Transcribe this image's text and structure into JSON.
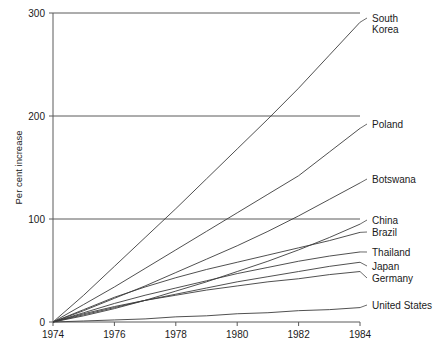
{
  "chart_data": {
    "type": "line",
    "title": "",
    "xlabel": "",
    "ylabel": "Per cent increase",
    "x": [
      1974,
      1975,
      1976,
      1977,
      1978,
      1979,
      1980,
      1981,
      1982,
      1983,
      1984
    ],
    "xlim": [
      1974,
      1984
    ],
    "ylim": [
      0,
      300
    ],
    "grid": true,
    "legend_position": "right-inline-labels",
    "xticks": [
      "1974",
      "1976",
      "1978",
      "1980",
      "1982",
      "1984"
    ],
    "xtick_values": [
      1974,
      1976,
      1978,
      1980,
      1982,
      1984
    ],
    "yticks": [
      "0",
      "100",
      "200",
      "300"
    ],
    "ytick_values": [
      0,
      100,
      200,
      300
    ],
    "series": [
      {
        "name": "South Korea",
        "label": "South Korea",
        "label_lines": [
          "South",
          "Korea"
        ],
        "values": [
          0,
          26,
          54,
          82,
          110,
          139,
          168,
          197,
          227,
          259,
          291
        ]
      },
      {
        "name": "Poland",
        "label": "Poland",
        "label_lines": [
          "Poland"
        ],
        "values": [
          0,
          17,
          34,
          52,
          70,
          88,
          106,
          124,
          142,
          165,
          188
        ]
      },
      {
        "name": "Botswana",
        "label": "Botswana",
        "label_lines": [
          "Botswana"
        ],
        "values": [
          0,
          11,
          23,
          35,
          48,
          61,
          74,
          88,
          103,
          119,
          135
        ]
      },
      {
        "name": "China",
        "label": "China",
        "label_lines": [
          "China"
        ],
        "values": [
          0,
          6,
          13,
          21,
          30,
          39,
          49,
          59,
          70,
          82,
          95
        ]
      },
      {
        "name": "Brazil",
        "label": "Brazil",
        "label_lines": [
          "Brazil"
        ],
        "values": [
          0,
          12,
          24,
          34,
          43,
          51,
          58,
          65,
          72,
          79,
          87
        ]
      },
      {
        "name": "Thailand",
        "label": "Thailand",
        "label_lines": [
          "Thailand"
        ],
        "values": [
          0,
          9,
          18,
          26,
          33,
          40,
          47,
          53,
          59,
          64,
          68
        ]
      },
      {
        "name": "Japan",
        "label": "Japan",
        "label_lines": [
          "Japan"
        ],
        "values": [
          0,
          7,
          14,
          21,
          27,
          33,
          39,
          44,
          49,
          54,
          58
        ]
      },
      {
        "name": "Germany",
        "label": "Germany",
        "label_lines": [
          "Germany"
        ],
        "values": [
          0,
          8,
          15,
          21,
          26,
          31,
          35,
          39,
          42,
          46,
          49
        ]
      },
      {
        "name": "United States",
        "label": "United States",
        "label_lines": [
          "United States"
        ],
        "values": [
          0,
          1,
          2,
          3,
          5,
          6,
          8,
          9,
          11,
          12,
          14
        ]
      }
    ]
  },
  "colors": {
    "line": "#3c3c3c",
    "axis": "#5a5a5a",
    "text": "#1a1a1a",
    "background": "#ffffff"
  }
}
